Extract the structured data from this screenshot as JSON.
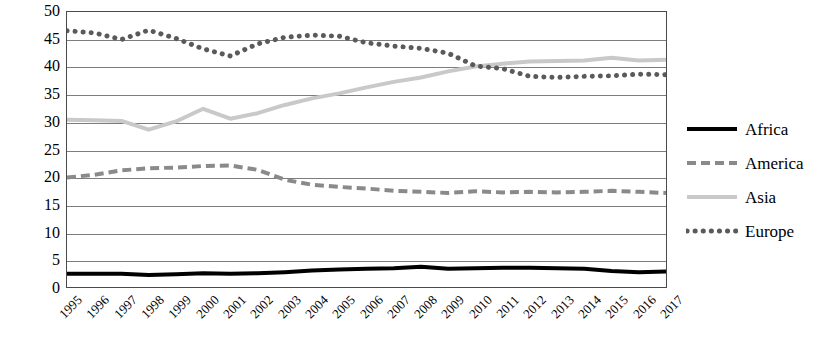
{
  "chart_data": {
    "type": "line",
    "title": "",
    "xlabel": "",
    "ylabel": "Share of world exports",
    "ylim": [
      0,
      50
    ],
    "ytick_step": 5,
    "yticks": [
      50,
      45,
      40,
      35,
      30,
      25,
      20,
      15,
      10,
      5,
      0
    ],
    "grid": true,
    "legend_position": "right",
    "categories": [
      "1995",
      "1996",
      "1997",
      "1998",
      "1999",
      "2000",
      "2001",
      "2002",
      "2003",
      "2004",
      "2005",
      "2006",
      "2007",
      "2008",
      "2009",
      "2010",
      "2011",
      "2012",
      "2013",
      "2014",
      "2015",
      "2016",
      "2017"
    ],
    "series": [
      {
        "name": "Africa",
        "style": "solid",
        "color": "#000000",
        "width": 4,
        "values": [
          2.4,
          2.4,
          2.4,
          2.2,
          2.3,
          2.5,
          2.4,
          2.5,
          2.7,
          3.0,
          3.2,
          3.3,
          3.4,
          3.7,
          3.3,
          3.4,
          3.5,
          3.5,
          3.4,
          3.3,
          2.9,
          2.7,
          2.8
        ]
      },
      {
        "name": "America",
        "style": "dashed",
        "color": "#8a8a8a",
        "width": 4,
        "values": [
          19.9,
          20.4,
          21.2,
          21.6,
          21.7,
          22.0,
          22.1,
          21.3,
          19.5,
          18.6,
          18.2,
          17.9,
          17.5,
          17.3,
          17.1,
          17.4,
          17.2,
          17.3,
          17.2,
          17.3,
          17.5,
          17.3,
          17.1
        ]
      },
      {
        "name": "Asia",
        "style": "solid",
        "color": "#c9c9c9",
        "width": 4,
        "values": [
          30.4,
          30.3,
          30.2,
          28.6,
          30.1,
          32.4,
          30.6,
          31.6,
          33.1,
          34.3,
          35.2,
          36.3,
          37.3,
          38.1,
          39.2,
          40.1,
          40.6,
          41.0,
          41.1,
          41.2,
          41.7,
          41.2,
          41.3
        ]
      },
      {
        "name": "Europe",
        "style": "dotted",
        "color": "#5a5a5a",
        "width": 5,
        "values": [
          46.6,
          46.2,
          45.0,
          46.7,
          45.2,
          43.3,
          42.0,
          44.2,
          45.4,
          45.8,
          45.6,
          44.4,
          43.8,
          43.4,
          42.5,
          40.2,
          39.7,
          38.3,
          38.1,
          38.3,
          38.4,
          38.7,
          38.6
        ]
      }
    ]
  },
  "legend": {
    "items": [
      {
        "label": "Africa"
      },
      {
        "label": "America"
      },
      {
        "label": "Asia"
      },
      {
        "label": "Europe"
      }
    ]
  }
}
